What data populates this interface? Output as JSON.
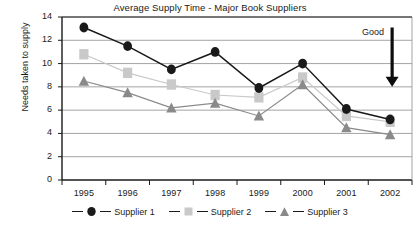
{
  "chart_data": {
    "type": "line",
    "title": "Average Supply Time - Major Book Suppliers",
    "xlabel": "",
    "ylabel": "Needs taken to supply",
    "categories": [
      "1995",
      "1996",
      "1997",
      "1998",
      "1999",
      "2000",
      "2001",
      "2002"
    ],
    "ylim": [
      0,
      14
    ],
    "ytick_step": 2,
    "yticks": [
      "0",
      "2",
      "4",
      "6",
      "8",
      "10",
      "12",
      "14"
    ],
    "grid": "horizontal",
    "legend_position": "bottom",
    "series": [
      {
        "name": "Supplier 1",
        "marker": "circle",
        "color": "#1a1a1a",
        "values": [
          13.1,
          11.5,
          9.5,
          11.0,
          7.9,
          10.0,
          6.1,
          5.2
        ]
      },
      {
        "name": "Supplier 2",
        "marker": "square",
        "color": "#c9c9c9",
        "values": [
          10.8,
          9.2,
          8.2,
          7.3,
          7.1,
          8.8,
          5.5,
          5.0
        ]
      },
      {
        "name": "Supplier 3",
        "marker": "triangle",
        "color": "#8a8a8a",
        "values": [
          8.5,
          7.5,
          6.2,
          6.6,
          5.5,
          8.2,
          4.5,
          3.9
        ]
      }
    ],
    "annotations": [
      {
        "label": "Good",
        "type": "arrow-down",
        "x_position": "2002",
        "y_from": 13.1,
        "y_to": 8.0
      }
    ]
  }
}
